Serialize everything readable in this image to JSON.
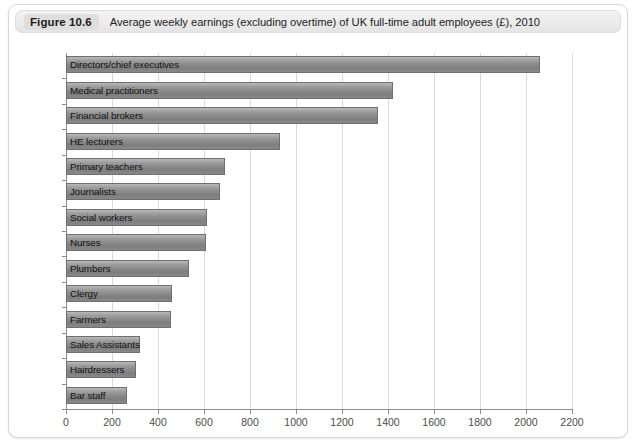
{
  "caption": {
    "number": "Figure 10.6",
    "text": "Average weekly earnings (excluding overtime) of UK full-time adult employees (£), 2010"
  },
  "chart_data": {
    "type": "bar",
    "orientation": "horizontal",
    "title": "Average weekly earnings (excluding overtime) of UK full-time adult employees (£), 2010",
    "xlabel": "",
    "ylabel": "",
    "xlim": [
      0,
      2200
    ],
    "xticks": [
      0,
      200,
      400,
      600,
      800,
      1000,
      1200,
      1400,
      1600,
      1800,
      2000,
      2200
    ],
    "grid": true,
    "legend": false,
    "categories": [
      "Directors/chief executives",
      "Medical practitioners",
      "Financial brokers",
      "HE lecturers",
      "Primary teachers",
      "Journalists",
      "Social workers",
      "Nurses",
      "Plumbers",
      "Clergy",
      "Farmers",
      "Sales Assistants",
      "Hairdressers",
      "Bar staff"
    ],
    "values": [
      2060,
      1420,
      1355,
      930,
      690,
      670,
      615,
      610,
      535,
      460,
      455,
      320,
      305,
      265
    ]
  },
  "colors": {
    "bar_top": "#b9b9b9",
    "bar_bottom": "#7e7e7e",
    "bar_border": "#6f6f6f",
    "grid": "#d9d9d9",
    "axis": "#8e8e8e",
    "caption_badge": "#dedede",
    "card_border": "#d8d8d8"
  }
}
